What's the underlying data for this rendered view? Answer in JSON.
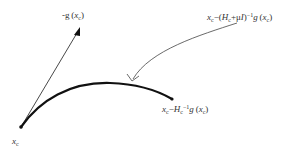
{
  "diagram": {
    "type": "geometric-illustration",
    "colors": {
      "ink": "#222222",
      "background": "#ffffff"
    },
    "nodes": [
      {
        "id": "start",
        "label_var": "x",
        "label_sub": "c",
        "x": 21,
        "y": 127
      },
      {
        "id": "newton",
        "x": 172,
        "y": 99
      },
      {
        "id": "gradient-tip",
        "x": 79,
        "y": 29
      }
    ],
    "labels": {
      "start": {
        "var": "x",
        "sub": "c"
      },
      "gradient": {
        "prefix": "-g",
        "open": "(",
        "var": "x",
        "sub": "c",
        "close": ")"
      },
      "lm_step": {
        "var": "x",
        "sub": "c",
        "minus": "−(",
        "H": "H",
        "H_sub": "c",
        "plus": "+μ",
        "I": "I",
        "close": ")",
        "inv": "−1",
        "g": "g",
        "open2": "(",
        "var2": "x",
        "sub2": "c",
        "close2": ")"
      },
      "newton_step": {
        "var": "x",
        "sub": "c",
        "minus": "−",
        "H": "H",
        "H_sub": "c",
        "inv": "−1",
        "g": "g",
        "open": "(",
        "var2": "x",
        "sub2": "c",
        "close": ")"
      }
    },
    "edges": [
      {
        "id": "gradient-arrow",
        "from": "start",
        "to": "gradient-tip",
        "style": "thin",
        "arrow": "filled"
      },
      {
        "id": "lm-curve",
        "from": "start",
        "to": "newton",
        "style": "thick",
        "arrow": "none"
      },
      {
        "id": "pointer-arrow",
        "from": "lm-label",
        "to": "lm-curve",
        "style": "thin-curved",
        "arrow": "open"
      }
    ]
  }
}
